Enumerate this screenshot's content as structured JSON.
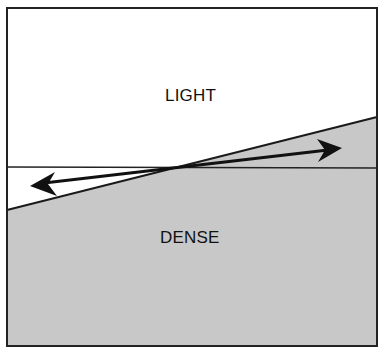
{
  "diagram": {
    "regions": [
      {
        "id": "light",
        "label": "LIGHT",
        "fill": "#ffffff"
      },
      {
        "id": "dense",
        "label": "DENSE",
        "fill": "#c8c8c8"
      }
    ],
    "lines": {
      "horizontal_reference": {
        "y": 167
      },
      "sloped_boundary": {
        "from": [
          7,
          210
        ],
        "to": [
          377,
          117
        ]
      }
    },
    "arrow": {
      "type": "double-headed",
      "from": [
        30,
        185
      ],
      "to": [
        342,
        148
      ]
    },
    "colors": {
      "frame": "#222222",
      "dense_fill": "#c8c8c8",
      "light_fill": "#ffffff",
      "arrow": "#111111"
    }
  }
}
